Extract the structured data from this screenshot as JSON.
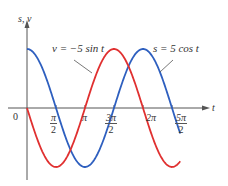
{
  "chart_data": {
    "type": "line",
    "title": "",
    "xlabel": "t",
    "ylabel": "s, v",
    "x_ticks": [
      {
        "value": 1.5708,
        "num": "π",
        "den": "2"
      },
      {
        "value": 3.1416,
        "label": "π"
      },
      {
        "value": 4.7124,
        "num": "3π",
        "den": "2"
      },
      {
        "value": 6.2832,
        "label": "2π"
      },
      {
        "value": 7.854,
        "num": "5π",
        "den": "2"
      }
    ],
    "origin_label": "0",
    "xlim": [
      0,
      8.3
    ],
    "ylim": [
      -5,
      5
    ],
    "grid": false,
    "series": [
      {
        "name": "s = 5 cos t",
        "color": "#2e5fbf",
        "function": "5*cos(t)"
      },
      {
        "name": "v = -5 sin t",
        "color": "#e03030",
        "function": "-5*sin(t)"
      }
    ],
    "annotations": [
      {
        "text": "v = −5 sin t",
        "points_to": "red curve"
      },
      {
        "text": "s = 5 cos t",
        "points_to": "blue curve"
      }
    ]
  },
  "labels": {
    "y_axis": "s, v",
    "x_axis": "t",
    "origin": "0",
    "annot_v": "v = −5 sin t",
    "annot_s": "s = 5 cos t",
    "tick_pi_half_num": "π",
    "tick_pi_half_den": "2",
    "tick_pi": "π",
    "tick_3pi_half_num": "3π",
    "tick_3pi_half_den": "2",
    "tick_2pi": "2π",
    "tick_5pi_half_num": "5π",
    "tick_5pi_half_den": "2"
  },
  "colors": {
    "blue": "#2e5fbf",
    "red": "#e03030",
    "axis": "#555555"
  }
}
